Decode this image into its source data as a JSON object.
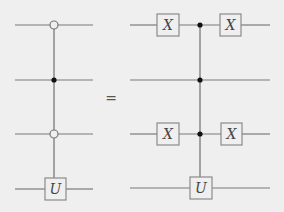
{
  "diagram": {
    "type": "quantum-circuit-identity",
    "relation": "=",
    "colors": {
      "background": "#efefef",
      "wire": "#7a7a7a",
      "box_stroke": "#8a8a8a",
      "filled_control": "#111111",
      "label": "#444444"
    },
    "left_circuit": {
      "num_wires": 4,
      "controls": [
        {
          "wire": 1,
          "kind": "open"
        },
        {
          "wire": 2,
          "kind": "filled"
        },
        {
          "wire": 3,
          "kind": "open"
        }
      ],
      "target": {
        "wire": 4,
        "gate": "U"
      }
    },
    "right_circuit": {
      "num_wires": 4,
      "gates_before": [
        {
          "wire": 1,
          "gate": "X"
        },
        {
          "wire": 3,
          "gate": "X"
        }
      ],
      "controls": [
        {
          "wire": 1,
          "kind": "filled"
        },
        {
          "wire": 2,
          "kind": "filled"
        },
        {
          "wire": 3,
          "kind": "filled"
        }
      ],
      "target": {
        "wire": 4,
        "gate": "U"
      },
      "gates_after": [
        {
          "wire": 1,
          "gate": "X"
        },
        {
          "wire": 3,
          "gate": "X"
        }
      ]
    },
    "labels": {
      "equals": "=",
      "left_U": "U",
      "right_X1_before": "X",
      "right_X1_after": "X",
      "right_X3_before": "X",
      "right_X3_after": "X",
      "right_U": "U"
    }
  }
}
